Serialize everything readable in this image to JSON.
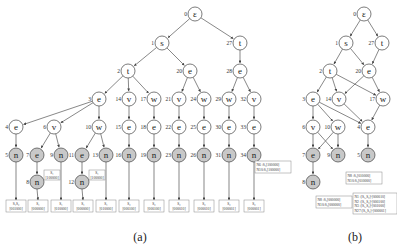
{
  "captions": {
    "a": "(a)",
    "b": "(b)"
  },
  "tree_a": {
    "nodes": [
      {
        "id": 0,
        "label": "ε",
        "x": 195,
        "y": 14,
        "gray": false
      },
      {
        "id": 1,
        "label": "s",
        "x": 162,
        "y": 43,
        "gray": false
      },
      {
        "id": 27,
        "label": "t",
        "x": 240,
        "y": 43,
        "gray": false
      },
      {
        "id": 2,
        "label": "t",
        "x": 128,
        "y": 71,
        "gray": false
      },
      {
        "id": 20,
        "label": "e",
        "x": 190,
        "y": 71,
        "gray": false
      },
      {
        "id": 28,
        "label": "e",
        "x": 240,
        "y": 71,
        "gray": false
      },
      {
        "id": 3,
        "label": "e",
        "x": 99,
        "y": 99,
        "gray": false
      },
      {
        "id": 14,
        "label": "v",
        "x": 129,
        "y": 99,
        "gray": false
      },
      {
        "id": 17,
        "label": "w",
        "x": 154,
        "y": 99,
        "gray": false
      },
      {
        "id": 21,
        "label": "v",
        "x": 179,
        "y": 99,
        "gray": false
      },
      {
        "id": 24,
        "label": "w",
        "x": 204,
        "y": 99,
        "gray": false
      },
      {
        "id": 29,
        "label": "w",
        "x": 229,
        "y": 99,
        "gray": false
      },
      {
        "id": 32,
        "label": "v",
        "x": 254,
        "y": 99,
        "gray": false
      },
      {
        "id": 4,
        "label": "e",
        "x": 16,
        "y": 127,
        "gray": false
      },
      {
        "id": 6,
        "label": "v",
        "x": 54,
        "y": 127,
        "gray": false
      },
      {
        "id": 10,
        "label": "w",
        "x": 99,
        "y": 127,
        "gray": false
      },
      {
        "id": 15,
        "label": "e",
        "x": 129,
        "y": 127,
        "gray": false
      },
      {
        "id": 18,
        "label": "e",
        "x": 154,
        "y": 127,
        "gray": false
      },
      {
        "id": 22,
        "label": "e",
        "x": 179,
        "y": 127,
        "gray": false
      },
      {
        "id": 25,
        "label": "e",
        "x": 204,
        "y": 127,
        "gray": false
      },
      {
        "id": 30,
        "label": "e",
        "x": 229,
        "y": 127,
        "gray": false
      },
      {
        "id": 33,
        "label": "e",
        "x": 254,
        "y": 127,
        "gray": false
      },
      {
        "id": 5,
        "label": "n",
        "x": 16,
        "y": 155,
        "gray": true
      },
      {
        "id": 7,
        "label": "e",
        "x": 37,
        "y": 155,
        "gray": true
      },
      {
        "id": 9,
        "label": "n",
        "x": 61,
        "y": 155,
        "gray": true
      },
      {
        "id": 11,
        "label": "e",
        "x": 82,
        "y": 155,
        "gray": true
      },
      {
        "id": 13,
        "label": "n",
        "x": 106,
        "y": 155,
        "gray": true
      },
      {
        "id": 16,
        "label": "n",
        "x": 129,
        "y": 155,
        "gray": true
      },
      {
        "id": 19,
        "label": "n",
        "x": 154,
        "y": 155,
        "gray": true
      },
      {
        "id": 23,
        "label": "n",
        "x": 179,
        "y": 155,
        "gray": true
      },
      {
        "id": 26,
        "label": "n",
        "x": 204,
        "y": 155,
        "gray": true
      },
      {
        "id": 31,
        "label": "n",
        "x": 229,
        "y": 155,
        "gray": true
      },
      {
        "id": 34,
        "label": "n",
        "x": 254,
        "y": 155,
        "gray": true
      },
      {
        "id": 8,
        "label": "n",
        "x": 37,
        "y": 182,
        "gray": true
      },
      {
        "id": 12,
        "label": "n",
        "x": 82,
        "y": 182,
        "gray": true
      }
    ],
    "edges": [
      [
        0,
        1
      ],
      [
        0,
        27
      ],
      [
        1,
        2
      ],
      [
        1,
        20
      ],
      [
        27,
        28
      ],
      [
        2,
        3
      ],
      [
        2,
        14
      ],
      [
        2,
        17
      ],
      [
        20,
        21
      ],
      [
        20,
        24
      ],
      [
        28,
        29
      ],
      [
        28,
        32
      ],
      [
        3,
        4
      ],
      [
        3,
        6
      ],
      [
        3,
        10
      ],
      [
        14,
        15
      ],
      [
        17,
        18
      ],
      [
        21,
        22
      ],
      [
        24,
        25
      ],
      [
        29,
        30
      ],
      [
        32,
        33
      ],
      [
        4,
        5
      ],
      [
        6,
        7
      ],
      [
        6,
        9
      ],
      [
        10,
        11
      ],
      [
        10,
        13
      ],
      [
        15,
        16
      ],
      [
        18,
        19
      ],
      [
        22,
        23
      ],
      [
        25,
        26
      ],
      [
        30,
        31
      ],
      [
        33,
        34
      ],
      [
        7,
        8
      ],
      [
        11,
        12
      ]
    ],
    "leaf_boxes": [
      {
        "from": 5,
        "x": 6,
        "y": 200,
        "w": 20,
        "l1": "S₁S₂",
        "l2": "[001000]"
      },
      {
        "from": 8,
        "x": 28,
        "y": 200,
        "w": 20,
        "l1": "S₁",
        "l2": "[000000]"
      },
      {
        "from": 9,
        "x": 51,
        "y": 200,
        "w": 20,
        "l1": "S₁",
        "l2": "[010000]"
      },
      {
        "from": 12,
        "x": 73,
        "y": 200,
        "w": 20,
        "l1": "S₁",
        "l2": "[000000]"
      },
      {
        "from": 13,
        "x": 96,
        "y": 200,
        "w": 20,
        "l1": "S₁",
        "l2": "[010000]"
      },
      {
        "from": 16,
        "x": 119,
        "y": 200,
        "w": 20,
        "l1": "S₂",
        "l2": "[000100]"
      },
      {
        "from": 19,
        "x": 144,
        "y": 200,
        "w": 20,
        "l1": "S₂",
        "l2": "[000100]"
      },
      {
        "from": 23,
        "x": 169,
        "y": 200,
        "w": 20,
        "l1": "S₂",
        "l2": "[000010]"
      },
      {
        "from": 26,
        "x": 194,
        "y": 200,
        "w": 20,
        "l1": "S₂",
        "l2": "[000010]"
      },
      {
        "from": 31,
        "x": 219,
        "y": 200,
        "w": 20,
        "l1": "S₂",
        "l2": "[000001]"
      },
      {
        "from": 34,
        "x": 244,
        "y": 200,
        "w": 20,
        "l1": "S₂",
        "l2": "[000001]"
      }
    ],
    "side_boxes": [
      {
        "x": 44,
        "y": 170,
        "w": 16,
        "l1": "S₁",
        "l2": "[100000]"
      },
      {
        "x": 89,
        "y": 170,
        "w": 16,
        "l1": "S₁",
        "l2": "[100000]"
      }
    ]
  },
  "tree_b": {
    "nodes": [
      {
        "id": 0,
        "label": "ε",
        "x": 364,
        "y": 14,
        "gray": false
      },
      {
        "id": 1,
        "label": "s",
        "x": 346,
        "y": 43,
        "gray": false
      },
      {
        "id": 27,
        "label": "t",
        "x": 382,
        "y": 43,
        "gray": false
      },
      {
        "id": 2,
        "label": "t",
        "x": 330,
        "y": 71,
        "gray": false
      },
      {
        "id": 20,
        "label": "e",
        "x": 369,
        "y": 71,
        "gray": false
      },
      {
        "id": 3,
        "label": "e",
        "x": 313,
        "y": 99,
        "gray": false
      },
      {
        "id": 14,
        "label": "v",
        "x": 339,
        "y": 99,
        "gray": false
      },
      {
        "id": 17,
        "label": "w",
        "x": 383,
        "y": 99,
        "gray": false
      },
      {
        "id": 6,
        "label": "v",
        "x": 313,
        "y": 127,
        "gray": false
      },
      {
        "id": 10,
        "label": "w",
        "x": 338,
        "y": 127,
        "gray": false
      },
      {
        "id": 4,
        "label": "e",
        "x": 368,
        "y": 127,
        "gray": false
      },
      {
        "id": 7,
        "label": "e",
        "x": 313,
        "y": 155,
        "gray": true
      },
      {
        "id": 9,
        "label": "n",
        "x": 338,
        "y": 155,
        "gray": true
      },
      {
        "id": 5,
        "label": "n",
        "x": 368,
        "y": 155,
        "gray": true
      },
      {
        "id": 8,
        "label": "n",
        "x": 313,
        "y": 182,
        "gray": true
      }
    ],
    "edges": [
      [
        0,
        1
      ],
      [
        0,
        27
      ],
      [
        1,
        2
      ],
      [
        1,
        20
      ],
      [
        27,
        20
      ],
      [
        2,
        3
      ],
      [
        2,
        14
      ],
      [
        2,
        17
      ],
      [
        20,
        14
      ],
      [
        20,
        17
      ],
      [
        3,
        6
      ],
      [
        3,
        10
      ],
      [
        3,
        4
      ],
      [
        14,
        4
      ],
      [
        17,
        4
      ],
      [
        6,
        7
      ],
      [
        6,
        9
      ],
      [
        10,
        7
      ],
      [
        10,
        9
      ],
      [
        4,
        5
      ],
      [
        7,
        8
      ]
    ],
    "boxes": [
      {
        "x": 255,
        "y": 161,
        "w": 36,
        "lines": [
          "N6 :S₁[100000]",
          "N10:S₁[100000]"
        ]
      },
      {
        "x": 316,
        "y": 196,
        "w": 36,
        "lines": [
          "N8 :S₁[000000]",
          "N10:S₁[000000]"
        ]
      },
      {
        "x": 346,
        "y": 172,
        "w": 36,
        "lines": [
          "N8 :S₁[010000]",
          "N10:S₁[010000]"
        ]
      },
      {
        "x": 353,
        "y": 193,
        "w": 44,
        "lines": [
          "N1  :[S₁,S₂]-[000010]",
          "N2  :[S₁,S₂]-[000100]",
          "N3  :[S₁,S₂]-[001000]",
          "N27:[S₁,S₂]-[000001]"
        ]
      }
    ]
  }
}
